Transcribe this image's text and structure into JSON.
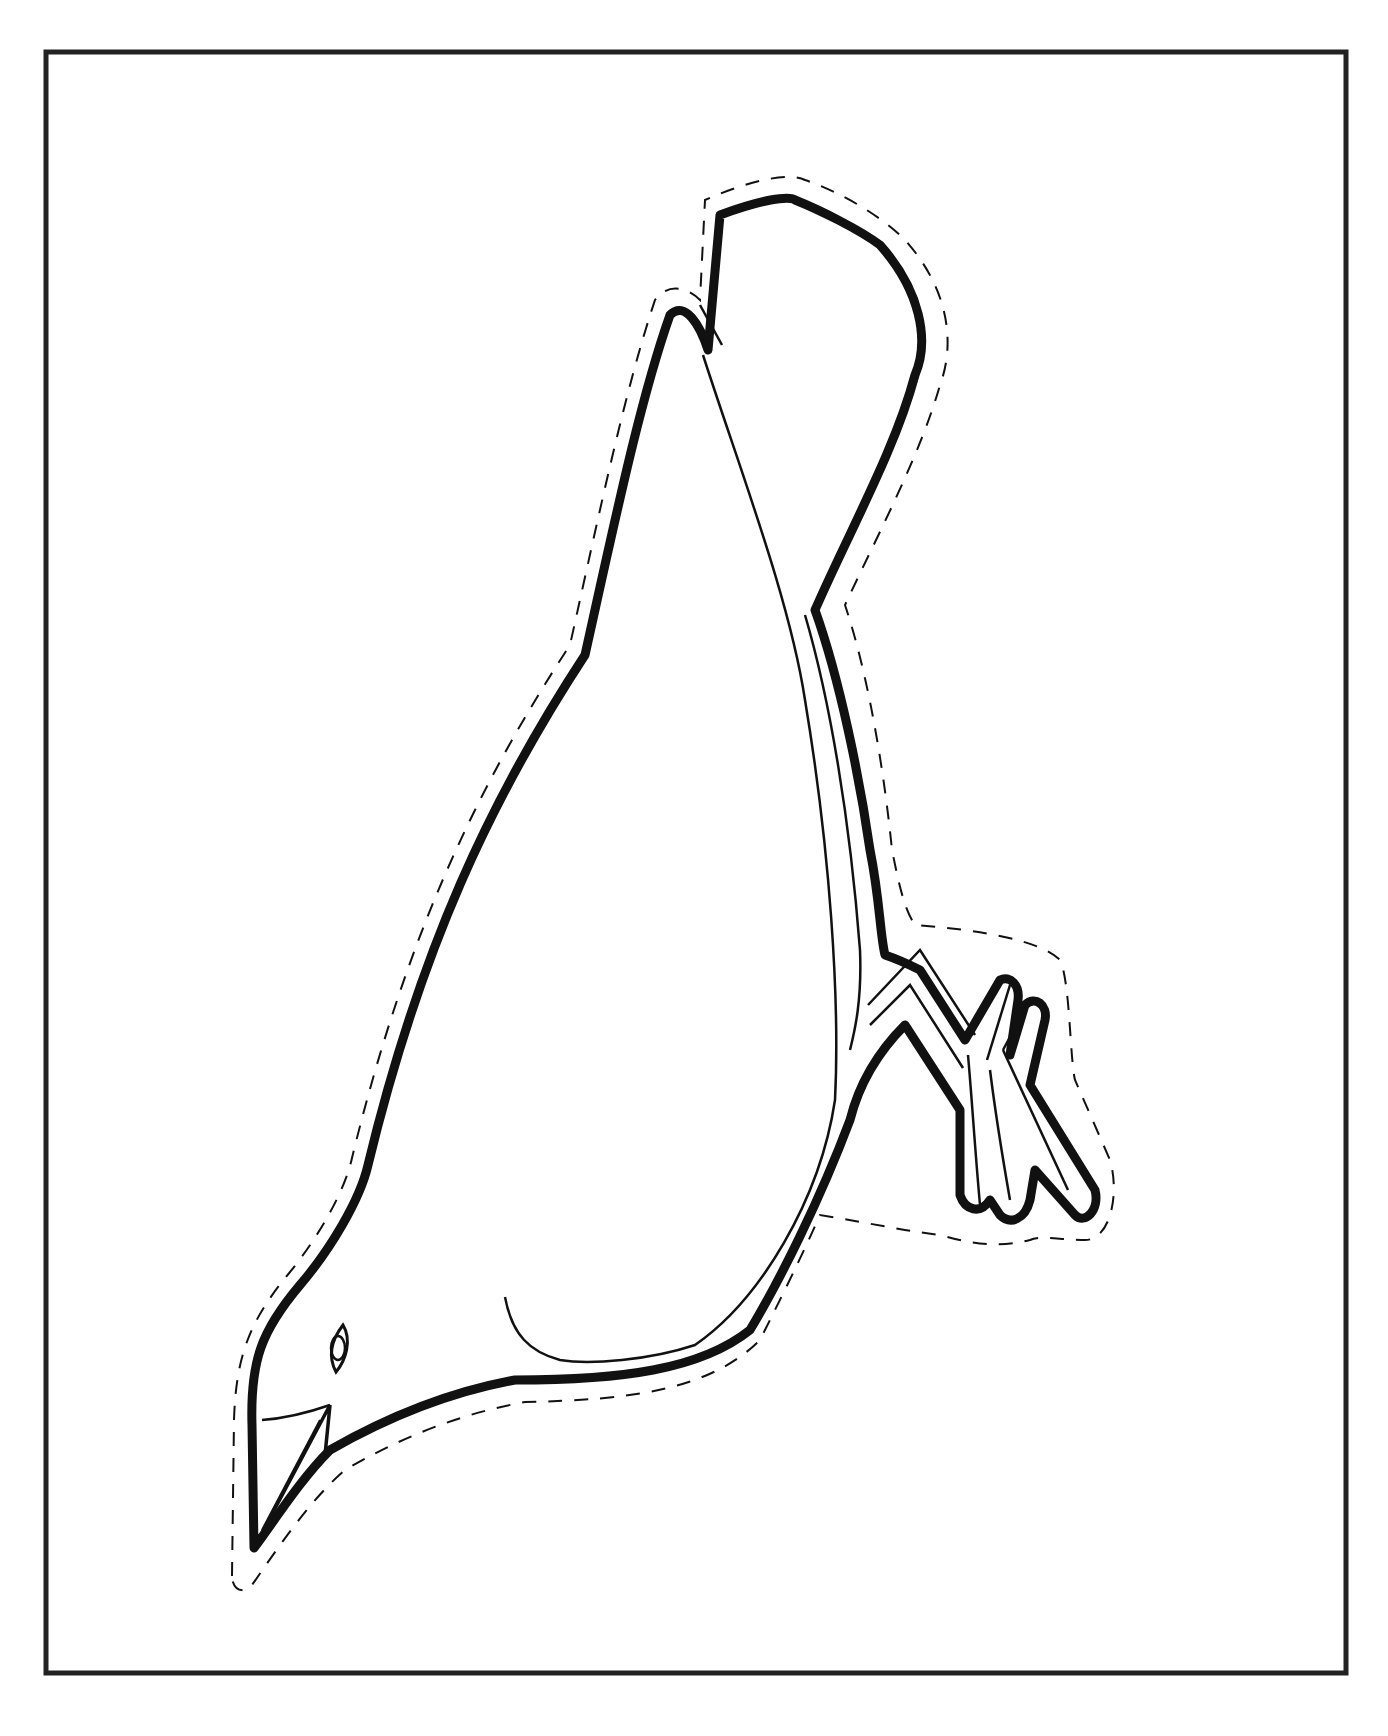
{
  "page": {
    "width": 1388,
    "height": 1736,
    "background": "#ffffff",
    "ink_color": "#111111"
  },
  "frame": {
    "x": 46,
    "y": 52,
    "width": 1300,
    "height": 1621,
    "stroke_width": 5,
    "color": "#222222"
  },
  "bird_cutout": {
    "title": "",
    "outline_stroke_width": 9,
    "detail_stroke_width": 2.5,
    "cut_line_stroke_width": 2,
    "cut_line_dash": "14 12",
    "outline_path": "M254 1548 L252 1425 C250 1360 262 1330 300 1285 C330 1250 360 1200 368 1165 C420 950 490 800 585 655 C615 520 640 400 670 315 C685 300 700 325 708 350 L720 215 C760 200 790 195 795 200 C820 210 860 230 880 245 C920 290 930 340 915 375 C895 450 850 530 815 610 C840 680 860 780 870 850 C880 900 880 935 885 955 C900 960 910 965 920 970 L965 1040 L1000 980 C1010 975 1020 985 1018 1000 L1010 1055 L1025 1005 C1035 995 1048 1005 1045 1020 L1030 1085 L1095 1190 C1100 1210 1085 1225 1075 1215 L1035 1170 L1030 1200 C1025 1220 1010 1225 1000 1215 L990 1200 C980 1215 965 1210 960 1195 L960 1110 L905 1025 C880 1050 860 1080 850 1120 C820 1200 780 1280 750 1330 C700 1370 620 1380 515 1380 C460 1390 400 1410 330 1450 C300 1480 275 1520 254 1548 Z",
    "cut_line_path": "M232 1576 L234 1420 C236 1355 250 1320 290 1272 C320 1235 345 1190 352 1158 C405 940 475 790 570 645 C600 510 625 390 655 300 C670 280 690 290 700 300 L705 200 C750 180 790 172 805 180 C840 192 880 215 905 240 C950 290 955 345 940 385 C920 455 880 530 845 605 C870 680 885 780 892 850 C900 890 905 910 915 925 C980 930 1040 940 1060 960 C1070 980 1070 1060 1075 1080 L1110 1160 C1120 1195 1110 1240 1085 1240 C1060 1240 1040 1235 1030 1240 C990 1250 960 1240 940 1235 C900 1230 880 1225 820 1215 C800 1260 780 1300 760 1340 C710 1390 630 1400 525 1402 C470 1412 410 1432 345 1470 C310 1500 280 1545 252 1585 C245 1595 232 1590 232 1576 Z",
    "wing_line_path": "M703 355 C740 470 790 600 805 700 C830 850 840 1000 835 1100 C820 1200 760 1300 695 1345 C650 1360 590 1365 560 1360 C530 1352 512 1335 505 1297",
    "belly_line_path": "M805 615 C830 700 850 820 860 950 C862 1000 855 1030 850 1050",
    "tail_line_path": "M700 305 L722 345",
    "beak": {
      "upper_curve_path": "M262 1420 C290 1418 310 1412 330 1405",
      "beak_shape_path": "M254 1548 L330 1405 L325 1455",
      "beak_center_line_path": "M262 1530 L320 1420"
    },
    "eye": {
      "outer_path": "M343 1325 C333 1338 327 1355 336 1372 C346 1360 352 1340 343 1325 Z",
      "inner_cx": 338,
      "inner_cy": 1348,
      "inner_rx": 7,
      "inner_ry": 12
    },
    "foot": {
      "inner_toe_lines": [
        "M868 1005 L920 950 L975 1035",
        "M870 1025 L910 985 L963 1068",
        "M968 1055 C972 1100 975 1150 980 1205",
        "M990 1070 C995 1110 1003 1160 1010 1200",
        "M1003 1050 L1068 1190",
        "M1003 1050 L1030 1000",
        "M987 1060 L1010 985"
      ]
    }
  }
}
